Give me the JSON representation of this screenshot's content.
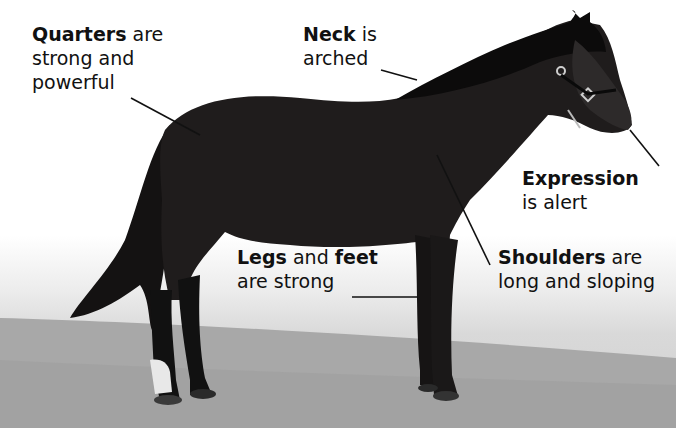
{
  "header": {
    "cropped_fragment": "g   ,"
  },
  "labels": {
    "quarters": {
      "bold": "Quarters",
      "rest1": " are",
      "line2": "strong and",
      "line3": "powerful"
    },
    "neck": {
      "bold": "Neck",
      "rest1": " is",
      "line2": "arched"
    },
    "expression": {
      "bold": "Expression",
      "line2": "is alert"
    },
    "legs": {
      "bold1": "Legs",
      "mid": " and ",
      "bold2": "feet",
      "line2": "are strong"
    },
    "shoulders": {
      "bold": "Shoulders",
      "rest1": " are",
      "line2": "long and sloping"
    }
  },
  "image": {
    "subject": "dark bay pony standing in profile facing right",
    "background": "white sky fading to grey sandy ground",
    "colors": {
      "horse": "#1c1a1a",
      "ground": "#a9a9a9",
      "sky": "#ffffff",
      "leader_lines": "#111111"
    }
  }
}
